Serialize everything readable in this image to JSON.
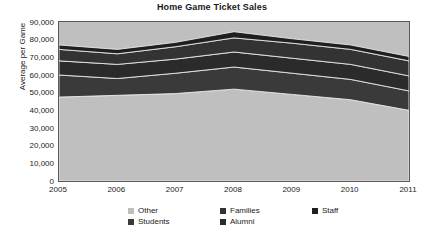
{
  "chart_data": {
    "type": "area",
    "stacked": true,
    "title": "Home Game Ticket Sales",
    "xlabel": "",
    "ylabel": "Average per Game",
    "categories": [
      "2005",
      "2006",
      "2007",
      "2008",
      "2009",
      "2010",
      "2011"
    ],
    "x": [
      2005,
      2006,
      2007,
      2008,
      2009,
      2010,
      2011
    ],
    "ylim": [
      0,
      90000
    ],
    "yticks": [
      0,
      10000,
      20000,
      30000,
      40000,
      50000,
      60000,
      70000,
      80000,
      90000
    ],
    "ytick_labels": [
      "0",
      "10,000",
      "20,000",
      "30,000",
      "40,000",
      "50,000",
      "60,000",
      "70,000",
      "80,000",
      "90,000"
    ],
    "grid": false,
    "legend_position": "bottom",
    "stack_order": [
      "Other",
      "Students",
      "Alumni",
      "Families",
      "Staff"
    ],
    "series": [
      {
        "name": "Other",
        "color": "#bfbfbf",
        "values": [
          47500,
          48500,
          49500,
          52000,
          49000,
          46000,
          40000
        ]
      },
      {
        "name": "Students",
        "color": "#3a3a3a",
        "values": [
          12500,
          9500,
          11500,
          12500,
          12000,
          11500,
          11000
        ]
      },
      {
        "name": "Alumni",
        "color": "#2b2b2b",
        "values": [
          8000,
          8000,
          8000,
          8500,
          8500,
          8500,
          8500
        ]
      },
      {
        "name": "Families",
        "color": "#333333",
        "values": [
          6500,
          6000,
          7000,
          8000,
          8500,
          8500,
          8500
        ]
      },
      {
        "name": "Staff",
        "color": "#1f1f1f",
        "values": [
          2500,
          2500,
          2500,
          3500,
          2500,
          2500,
          2500
        ]
      }
    ],
    "cumulative_totals": {
      "Other": [
        47500,
        48500,
        49500,
        52000,
        49000,
        46000,
        40000
      ],
      "Students": [
        60000,
        58000,
        61000,
        64500,
        61000,
        57500,
        51000
      ],
      "Alumni": [
        68000,
        66000,
        69000,
        73000,
        69500,
        66000,
        59500
      ],
      "Families": [
        74500,
        72000,
        76000,
        81000,
        78000,
        74500,
        68000
      ],
      "Staff": [
        77000,
        74500,
        78500,
        84500,
        80500,
        77000,
        70500
      ]
    }
  },
  "legend": {
    "entries": [
      {
        "label": "Other",
        "color": "#bfbfbf"
      },
      {
        "label": "Families",
        "color": "#333333"
      },
      {
        "label": "Staff",
        "color": "#1f1f1f"
      },
      {
        "label": "Students",
        "color": "#3a3a3a"
      },
      {
        "label": "Alumni",
        "color": "#2b2b2b"
      }
    ]
  },
  "colors": {
    "plot_background": "#bfbfbf",
    "plot_border": "#5a5a5a",
    "page_background": "#ffffff",
    "text": "#1a1a1a",
    "separator": "#e8e8e8"
  }
}
